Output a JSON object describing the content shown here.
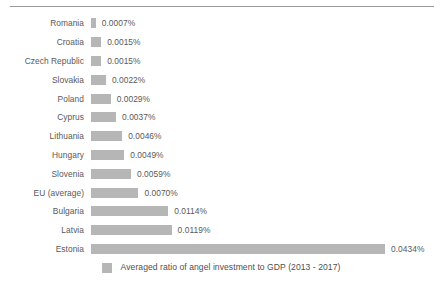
{
  "chart_data": {
    "type": "bar",
    "orientation": "horizontal",
    "title": "",
    "subtitle": "",
    "xlabel": "",
    "ylabel": "",
    "grid": false,
    "legend_position": "bottom",
    "unit": "%",
    "xlim": [
      0,
      0.0434
    ],
    "categories": [
      "Romania",
      "Croatia",
      "Czech Republic",
      "Slovakia",
      "Poland",
      "Cyprus",
      "Lithuania",
      "Hungary",
      "Slovenia",
      "EU (average)",
      "Bulgaria",
      "Latvia",
      "Estonia"
    ],
    "values": [
      0.0007,
      0.0015,
      0.0015,
      0.0022,
      0.0029,
      0.0037,
      0.0046,
      0.0049,
      0.0059,
      0.007,
      0.0114,
      0.0119,
      0.0434
    ],
    "value_labels": [
      "0.0007%",
      "0.0015%",
      "0.0015%",
      "0.0022%",
      "0.0029%",
      "0.0037%",
      "0.0046%",
      "0.0049%",
      "0.0059%",
      "0.0070%",
      "0.0114%",
      "0.0119%",
      "0.0434%"
    ],
    "series": [
      {
        "name": "Averaged ratio of angel investment to GDP (2013 - 2017)",
        "color": "#b6b6b6",
        "values": [
          0.0007,
          0.0015,
          0.0015,
          0.0022,
          0.0029,
          0.0037,
          0.0046,
          0.0049,
          0.0059,
          0.007,
          0.0114,
          0.0119,
          0.0434
        ]
      }
    ]
  },
  "legend": {
    "label": "Averaged ratio of angel investment to GDP (2013 - 2017)",
    "swatch_color": "#b6b6b6"
  },
  "style": {
    "bar_color": "#b6b6b6",
    "text_color": "#595959",
    "rule_color": "#9a9a9a",
    "background": "#ffffff"
  }
}
